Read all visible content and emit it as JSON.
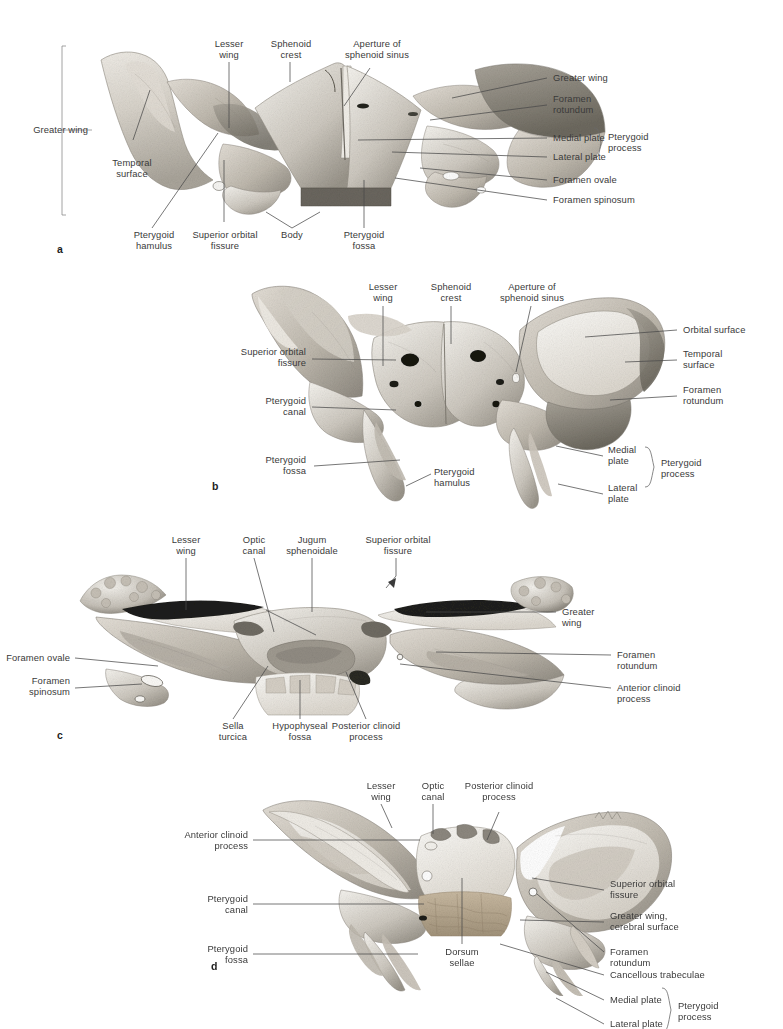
{
  "figure": {
    "panel_count": 4
  },
  "panels": [
    {
      "letter": "a",
      "view": "anterior view of sphenoid bone",
      "labels": [
        {
          "id": "a-greater-wing-left",
          "text": "Greater wing",
          "align": "right"
        },
        {
          "id": "a-temporal-surface",
          "text": "Temporal\nsurface",
          "align": "center"
        },
        {
          "id": "a-lesser-wing",
          "text": "Lesser\nwing",
          "align": "center"
        },
        {
          "id": "a-sphenoid-crest",
          "text": "Sphenoid\ncrest",
          "align": "center"
        },
        {
          "id": "a-aperture-sphenoid-sinus",
          "text": "Aperture of\nsphenoid sinus",
          "align": "center"
        },
        {
          "id": "a-greater-wing-right",
          "text": "Greater wing",
          "align": "left"
        },
        {
          "id": "a-foramen-rotundum",
          "text": "Foramen\nrotundum",
          "align": "left"
        },
        {
          "id": "a-medial-plate",
          "text": "Medial plate",
          "align": "left"
        },
        {
          "id": "a-lateral-plate",
          "text": "Lateral plate",
          "align": "left"
        },
        {
          "id": "a-pterygoid-process",
          "text": "Pterygoid\nprocess",
          "align": "left"
        },
        {
          "id": "a-foramen-ovale",
          "text": "Foramen ovale",
          "align": "left"
        },
        {
          "id": "a-foramen-spinosum",
          "text": "Foramen spinosum",
          "align": "left"
        },
        {
          "id": "a-pterygoid-hamulus",
          "text": "Pterygoid\nhamulus",
          "align": "center"
        },
        {
          "id": "a-superior-orbital-fissure",
          "text": "Superior orbital\nfissure",
          "align": "center"
        },
        {
          "id": "a-body",
          "text": "Body",
          "align": "center"
        },
        {
          "id": "a-pterygoid-fossa",
          "text": "Pterygoid\nfossa",
          "align": "center"
        }
      ]
    },
    {
      "letter": "b",
      "view": "posterior view of sphenoid bone",
      "labels": [
        {
          "id": "b-lesser-wing",
          "text": "Lesser\nwing",
          "align": "center"
        },
        {
          "id": "b-sphenoid-crest",
          "text": "Sphenoid\ncrest",
          "align": "center"
        },
        {
          "id": "b-aperture-sphenoid-sinus",
          "text": "Aperture of\nsphenoid sinus",
          "align": "center"
        },
        {
          "id": "b-superior-orbital-fissure",
          "text": "Superior orbital\nfissure",
          "align": "right"
        },
        {
          "id": "b-pterygoid-canal",
          "text": "Pterygoid\ncanal",
          "align": "right"
        },
        {
          "id": "b-pterygoid-fossa",
          "text": "Pterygoid\nfossa",
          "align": "right"
        },
        {
          "id": "b-pterygoid-hamulus",
          "text": "Pterygoid\nhamulus",
          "align": "left"
        },
        {
          "id": "b-orbital-surface",
          "text": "Orbital surface",
          "align": "left"
        },
        {
          "id": "b-temporal-surface",
          "text": "Temporal\nsurface",
          "align": "left"
        },
        {
          "id": "b-foramen-rotundum",
          "text": "Foramen\nrotundum",
          "align": "left"
        },
        {
          "id": "b-medial-plate",
          "text": "Medial\nplate",
          "align": "left"
        },
        {
          "id": "b-lateral-plate",
          "text": "Lateral\nplate",
          "align": "left"
        },
        {
          "id": "b-pterygoid-process",
          "text": "Pterygoid\nprocess",
          "align": "left"
        }
      ]
    },
    {
      "letter": "c",
      "view": "superior view of sphenoid bone",
      "labels": [
        {
          "id": "c-lesser-wing",
          "text": "Lesser\nwing",
          "align": "center"
        },
        {
          "id": "c-optic-canal",
          "text": "Optic\ncanal",
          "align": "center"
        },
        {
          "id": "c-jugum-sphenoidale",
          "text": "Jugum\nsphenoidale",
          "align": "center"
        },
        {
          "id": "c-superior-orbital-fissure",
          "text": "Superior orbital\nfissure",
          "align": "center"
        },
        {
          "id": "c-greater-wing",
          "text": "Greater\nwing",
          "align": "left"
        },
        {
          "id": "c-foramen-rotundum",
          "text": "Foramen\nrotundum",
          "align": "left"
        },
        {
          "id": "c-anterior-clinoid-process",
          "text": "Anterior clinoid\nprocess",
          "align": "left"
        },
        {
          "id": "c-foramen-ovale",
          "text": "Foramen ovale",
          "align": "right"
        },
        {
          "id": "c-foramen-spinosum",
          "text": "Foramen\nspinosum",
          "align": "right"
        },
        {
          "id": "c-sella-turcica",
          "text": "Sella\nturcica",
          "align": "center"
        },
        {
          "id": "c-hypophyseal-fossa",
          "text": "Hypophyseal\nfossa",
          "align": "center"
        },
        {
          "id": "c-posterior-clinoid-process",
          "text": "Posterior clinoid\nprocess",
          "align": "center"
        }
      ]
    },
    {
      "letter": "d",
      "view": "anterosuperior oblique view of sphenoid bone",
      "labels": [
        {
          "id": "d-lesser-wing",
          "text": "Lesser\nwing",
          "align": "center"
        },
        {
          "id": "d-optic-canal",
          "text": "Optic\ncanal",
          "align": "center"
        },
        {
          "id": "d-posterior-clinoid-process",
          "text": "Posterior clinoid\nprocess",
          "align": "center"
        },
        {
          "id": "d-anterior-clinoid-process",
          "text": "Anterior clinoid\nprocess",
          "align": "right"
        },
        {
          "id": "d-pterygoid-canal",
          "text": "Pterygoid\ncanal",
          "align": "right"
        },
        {
          "id": "d-pterygoid-fossa",
          "text": "Pterygoid\nfossa",
          "align": "right"
        },
        {
          "id": "d-dorsum-sellae",
          "text": "Dorsum\nsellae",
          "align": "center"
        },
        {
          "id": "d-superior-orbital-fissure",
          "text": "Superior orbital\nfissure",
          "align": "left"
        },
        {
          "id": "d-greater-wing-cerebral-surface",
          "text": "Greater wing,\ncerebral surface",
          "align": "left"
        },
        {
          "id": "d-foramen-rotundum",
          "text": "Foramen\nrotundum",
          "align": "left"
        },
        {
          "id": "d-cancellous-trabeculae",
          "text": "Cancellous trabeculae",
          "align": "left"
        },
        {
          "id": "d-medial-plate",
          "text": "Medial plate",
          "align": "left"
        },
        {
          "id": "d-lateral-plate",
          "text": "Lateral plate",
          "align": "left"
        },
        {
          "id": "d-pterygoid-process",
          "text": "Pterygoid\nprocess",
          "align": "left"
        }
      ]
    }
  ],
  "colors": {
    "background": "#ffffff",
    "text": "#3a3a3a",
    "leader_line": "#4a4a4a",
    "bone_light": "#e9e5de",
    "bone_mid": "#c9c4ba",
    "bone_dark": "#9b968c",
    "bone_shadow": "#6f6b63",
    "cancellous": "#b8aa94"
  }
}
